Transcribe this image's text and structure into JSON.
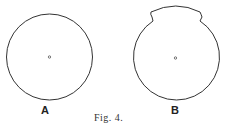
{
  "figure": {
    "caption": "Fig. 4.",
    "panels": [
      {
        "label": "A",
        "shape": "circle with center dot"
      },
      {
        "label": "B",
        "shape": "circle with raised notched top segment and center dot"
      }
    ]
  },
  "colors": {
    "stroke": "#333333",
    "background": "#ffffff"
  }
}
